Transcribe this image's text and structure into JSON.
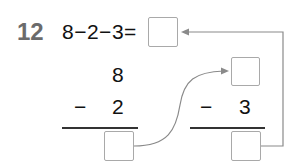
{
  "problem": {
    "number": "12",
    "equation": "8−2−3=",
    "answer": ""
  },
  "column_left": {
    "top": "8",
    "operator": "−",
    "subtrahend": "2",
    "result": ""
  },
  "column_right": {
    "top": "",
    "operator": "−",
    "subtrahend": "3",
    "result": ""
  },
  "colors": {
    "number": "#6b6b6b",
    "box_border": "#a9a9a9",
    "arrow": "#8a8a8a"
  }
}
